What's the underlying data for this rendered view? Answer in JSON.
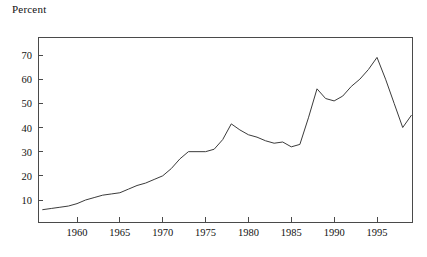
{
  "figure": {
    "axis_title": "Percent",
    "line_color": "#3b3b3b",
    "axis_color": "#4a4a4a",
    "background": "#ffffff"
  },
  "chart_data": {
    "type": "line",
    "title": "",
    "subtitle": "",
    "xlabel": "",
    "ylabel": "Percent",
    "grid": false,
    "legend": false,
    "legend_position": "none",
    "xlim": [
      1956,
      1999
    ],
    "ylim": [
      0,
      77
    ],
    "xticks": [
      1960,
      1965,
      1970,
      1975,
      1980,
      1985,
      1990,
      1995
    ],
    "xtick_labels": [
      "1960",
      "1965",
      "1970",
      "1975",
      "1980",
      "1985",
      "1990",
      "1995"
    ],
    "yticks": [
      10,
      20,
      30,
      40,
      50,
      60,
      70
    ],
    "ytick_labels": [
      "10",
      "20",
      "30",
      "40",
      "50",
      "60",
      "70"
    ],
    "series": [
      {
        "name": "Percent",
        "x": [
          1956,
          1957,
          1958,
          1959,
          1960,
          1961,
          1962,
          1963,
          1964,
          1965,
          1966,
          1967,
          1968,
          1969,
          1970,
          1971,
          1972,
          1973,
          1974,
          1975,
          1976,
          1977,
          1978,
          1979,
          1980,
          1981,
          1982,
          1983,
          1984,
          1985,
          1986,
          1987,
          1988,
          1989,
          1990,
          1991,
          1992,
          1993,
          1994,
          1995,
          1996,
          1997,
          1998,
          1999
        ],
        "values": [
          6,
          6.5,
          7,
          7.5,
          8.5,
          10,
          11,
          12,
          12.5,
          13,
          14.5,
          16,
          17,
          18.5,
          20,
          23,
          27,
          30,
          30,
          30,
          31,
          35,
          41.5,
          39,
          37,
          36,
          34.5,
          33.5,
          34,
          32,
          33,
          44,
          56,
          52,
          51,
          53,
          57,
          60,
          64,
          69,
          60,
          50,
          40,
          45
        ]
      }
    ]
  }
}
